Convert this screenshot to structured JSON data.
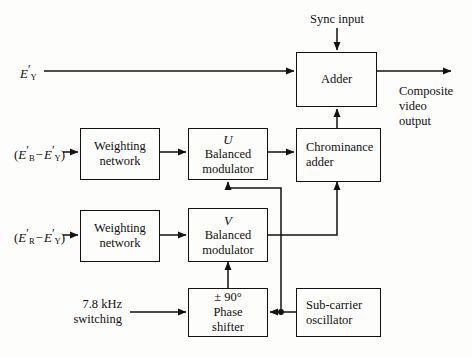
{
  "diagram": {
    "background": "#fdfdfc",
    "line_color": "#121212",
    "blocks": [
      {
        "id": "adder",
        "label": "Adder",
        "line1": "Adder",
        "line2": "",
        "italic": ""
      },
      {
        "id": "weighting_u",
        "label": "Weighting network",
        "line1": "Weighting",
        "line2": "network",
        "italic": ""
      },
      {
        "id": "weighting_v",
        "label": "Weighting network",
        "line1": "Weighting",
        "line2": "network",
        "italic": ""
      },
      {
        "id": "mod_u",
        "label": "U Balanced modulator",
        "line1": "Balanced",
        "line2": "modulator",
        "italic": "U"
      },
      {
        "id": "mod_v",
        "label": "V Balanced modulator",
        "line1": "Balanced",
        "line2": "modulator",
        "italic": "V"
      },
      {
        "id": "chroma_adder",
        "label": "Chrominance adder",
        "line1": "Chrominance",
        "line2": "adder",
        "italic": ""
      },
      {
        "id": "phase_shifter",
        "label": "± 90° Phase shifter",
        "line1": "Phase",
        "line2": "shifter",
        "italic": "± 90°"
      },
      {
        "id": "subcarrier",
        "label": "Sub-carrier oscillator",
        "line1": "Sub-carrier",
        "line2": "oscillator",
        "italic": ""
      }
    ],
    "labels": {
      "sync_input": "Sync input",
      "composite_output": "Composite\nvideo\noutput",
      "switching": "7.8 kHz\nswitching",
      "luma_input": "E'Y",
      "blue_diff_input": "(E'B − E'Y)",
      "red_diff_input": "(E'R − E'Y)"
    },
    "signals": {
      "luma_symbol": "E",
      "luma_sub": "Y",
      "blue_sub": "B",
      "red_sub": "R",
      "prime": "′",
      "minus": "−",
      "open_paren": "(",
      "close_paren": ")"
    }
  }
}
